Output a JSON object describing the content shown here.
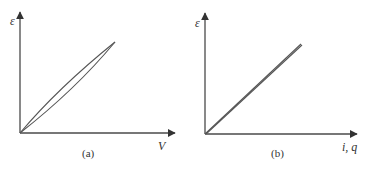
{
  "figure": {
    "panels": [
      {
        "id": "a",
        "caption": "(a)",
        "y_axis_label": "ε",
        "x_axis_label": "V",
        "description": "Hysteresis loop: two curves from the origin to a common tip, upper curve bowed outward (nonlinear)"
      },
      {
        "id": "b",
        "caption": "(b)",
        "y_axis_label": "ε",
        "x_axis_label": "i, q",
        "description": "Nearly linear relation: two almost coincident straight lines from the origin"
      }
    ]
  },
  "colors": {
    "axis": "#4a4a4a",
    "curve": "#555555",
    "text": "#333333",
    "background": "#ffffff"
  }
}
